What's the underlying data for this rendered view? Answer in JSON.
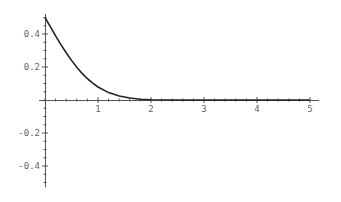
{
  "chart_data": {
    "type": "line",
    "title": "",
    "xlabel": "",
    "ylabel": "",
    "xlim": [
      0,
      5.1
    ],
    "ylim": [
      -0.53,
      0.52
    ],
    "grid": false,
    "legend": null,
    "x_ticks": [
      "1",
      "2",
      "3",
      "4",
      "5"
    ],
    "y_ticks": [
      "0.4",
      "0.2",
      "-0.2",
      "-0.4"
    ],
    "series": [
      {
        "name": "f(x)",
        "color": "#222222",
        "x": [
          0,
          0.1,
          0.2,
          0.3,
          0.4,
          0.5,
          0.6,
          0.7,
          0.8,
          0.9,
          1.0,
          1.2,
          1.4,
          1.6,
          1.8,
          2.0,
          2.5,
          3.0,
          3.5,
          4.0,
          4.5,
          5.0
        ],
        "values": [
          0.5,
          0.444,
          0.389,
          0.336,
          0.286,
          0.24,
          0.198,
          0.161,
          0.129,
          0.102,
          0.079,
          0.045,
          0.024,
          0.012,
          0.005,
          0.002,
          0.0,
          0.0,
          0.0,
          0.0,
          0.0,
          0.0
        ]
      }
    ]
  }
}
